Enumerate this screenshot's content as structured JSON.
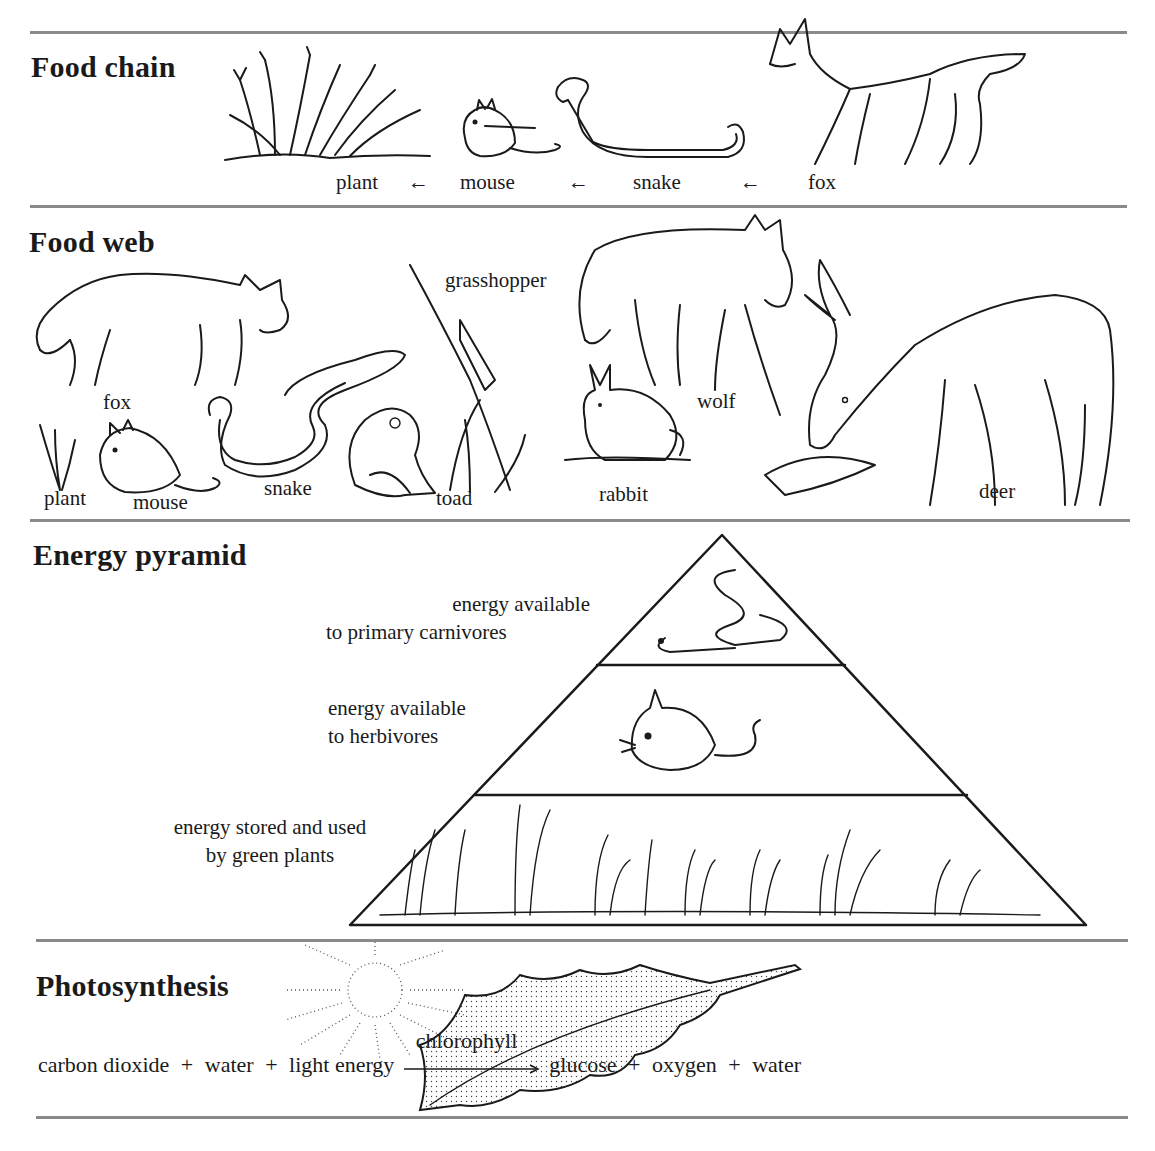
{
  "sections": {
    "food_chain": {
      "heading": "Food chain",
      "chain": [
        "plant",
        "mouse",
        "snake",
        "fox"
      ],
      "arrow": "←"
    },
    "food_web": {
      "heading": "Food web",
      "organisms": [
        "fox",
        "grasshopper",
        "wolf",
        "plant",
        "mouse",
        "snake",
        "toad",
        "rabbit",
        "deer"
      ]
    },
    "energy_pyramid": {
      "heading": "Energy pyramid",
      "levels": [
        {
          "line1": "energy available",
          "line2": "to primary carnivores",
          "illustration": "snake"
        },
        {
          "line1": "energy available",
          "line2": "to herbivores",
          "illustration": "mouse"
        },
        {
          "line1": "energy stored and used",
          "line2": "by green plants",
          "illustration": "grass"
        }
      ]
    },
    "photosynthesis": {
      "heading": "Photosynthesis",
      "reactants": [
        "carbon dioxide",
        "water",
        "light energy"
      ],
      "catalyst": "chlorophyll",
      "products": [
        "glucose",
        "oxygen",
        "water"
      ],
      "plus": "+"
    }
  }
}
